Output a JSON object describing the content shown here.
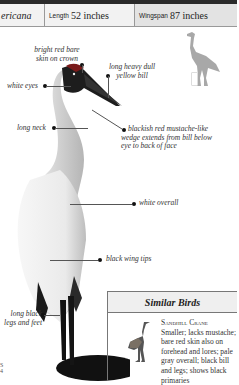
{
  "header": {
    "species_fragment": "ericana",
    "length_label": "Length",
    "length_value": "52 inches",
    "wingspan_label": "Wingspan",
    "wingspan_value": "87 inches"
  },
  "annotations": {
    "crown": "bright red bare skin on crown",
    "crown_l1": "bright red bare",
    "crown_l2": "skin on crown",
    "bill_l1": "long heavy dull",
    "bill_l2": "yellow bill",
    "eyes": "white eyes",
    "neck": "long neck",
    "mustache_l1": "blackish red mustache-like",
    "mustache_l2": "wedge extends from bill below",
    "mustache_l3": "eye to back of face",
    "overall": "white overall",
    "wingtips": "black wing tips",
    "legs_l1": "long black",
    "legs_l2": "legs and feet"
  },
  "similar_birds": {
    "title": "Similar Birds",
    "name": "Sandhill Crane",
    "description": "Smaller; lacks mustache; bare red skin also on forehead and lores; pale gray overall; black bill and legs; shows black primaries"
  },
  "page_marks": {
    "a": "S",
    "b": "4"
  },
  "colors": {
    "silhouette": "#a8a8a8",
    "header_bg": "#f2f2f2",
    "header_bg_alt": "#e3e3e3"
  }
}
